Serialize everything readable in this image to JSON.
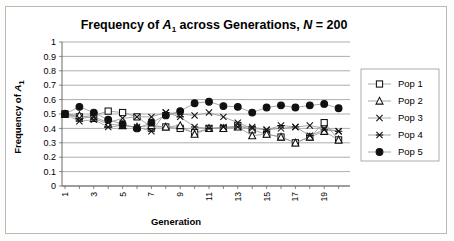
{
  "chart_data": {
    "type": "line",
    "title": "Frequency of A1 across Generations,  N = 200",
    "title_parts": {
      "p1": "Frequency of ",
      "italic_a": "A",
      "sub1": "1",
      "p2": " across Generations,  ",
      "italic_n": "N",
      "p3": " = 200"
    },
    "xlabel": "Generation",
    "ylabel_parts": {
      "p1": "Frequency of ",
      "italic_a": "A",
      "sub1": "1"
    },
    "ylabel": "Frequency of A1",
    "xlim": [
      1,
      20
    ],
    "ylim": [
      0,
      1
    ],
    "yticks": [
      "1",
      "0.9",
      "0.8",
      "0.7",
      "0.6",
      "0.5",
      "0.4",
      "0.3",
      "0.2",
      "0.1",
      "0"
    ],
    "ytick_values": [
      1,
      0.9,
      0.8,
      0.7,
      0.6,
      0.5,
      0.4,
      0.3,
      0.2,
      0.1,
      0
    ],
    "x": [
      1,
      2,
      3,
      4,
      5,
      6,
      7,
      8,
      9,
      10,
      11,
      12,
      13,
      14,
      15,
      16,
      17,
      18,
      19,
      20
    ],
    "xticks_labeled": [
      "1",
      "3",
      "5",
      "7",
      "9",
      "11",
      "13",
      "15",
      "17",
      "19"
    ],
    "grid": true,
    "legend_position": "right",
    "series": [
      {
        "name": "Pop 1",
        "marker": "open-square",
        "values": [
          0.5,
          0.48,
          0.49,
          0.52,
          0.51,
          0.48,
          0.41,
          0.41,
          0.4,
          0.37,
          0.4,
          0.4,
          0.42,
          0.39,
          0.36,
          0.34,
          0.3,
          0.34,
          0.44,
          0.32
        ]
      },
      {
        "name": "Pop 2",
        "marker": "open-triangle",
        "values": [
          0.5,
          0.49,
          0.47,
          0.43,
          0.42,
          0.41,
          0.42,
          0.41,
          0.42,
          0.36,
          0.4,
          0.4,
          0.41,
          0.35,
          0.36,
          0.34,
          0.3,
          0.34,
          0.38,
          0.32
        ]
      },
      {
        "name": "Pop 3",
        "marker": "cross-x",
        "values": [
          0.5,
          0.47,
          0.48,
          0.44,
          0.47,
          0.48,
          0.48,
          0.51,
          0.5,
          0.49,
          0.51,
          0.48,
          0.44,
          0.4,
          0.39,
          0.4,
          0.41,
          0.42,
          0.4,
          0.38
        ]
      },
      {
        "name": "Pop 4",
        "marker": "asterisk",
        "values": [
          0.5,
          0.45,
          0.46,
          0.41,
          0.42,
          0.41,
          0.38,
          0.51,
          0.48,
          0.41,
          0.4,
          0.41,
          0.41,
          0.41,
          0.39,
          0.42,
          0.41,
          0.35,
          0.39,
          0.38
        ]
      },
      {
        "name": "Pop 5",
        "marker": "filled-circle",
        "values": [
          0.5,
          0.55,
          0.51,
          0.46,
          0.43,
          0.4,
          0.44,
          0.49,
          0.52,
          0.575,
          0.585,
          0.555,
          0.55,
          0.51,
          0.545,
          0.56,
          0.545,
          0.56,
          0.57,
          0.54
        ]
      }
    ]
  }
}
